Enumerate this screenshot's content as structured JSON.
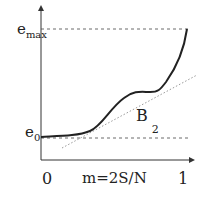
{
  "diagram": {
    "y_label_max": "e",
    "y_label_max_sub": "max",
    "y_label_min": "e",
    "y_label_min_sub": "0",
    "x_label_start": "0",
    "x_label_mid": "m=2S/N",
    "x_label_end": "1",
    "curve_label": "B",
    "curve_label_sub": "2",
    "colors": {
      "curve": "#222222",
      "axis": "#333333",
      "dashed": "#444444",
      "dotted": "#999999"
    }
  }
}
